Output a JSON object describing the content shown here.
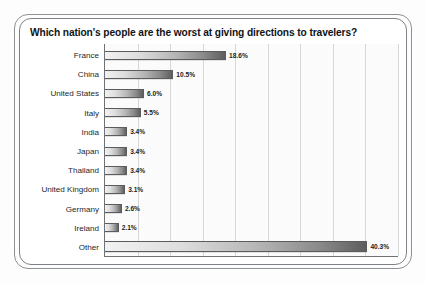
{
  "chart_data": {
    "type": "bar",
    "orientation": "horizontal",
    "title": "Which nation's people are the worst at giving directions to travelers?",
    "xlabel": "",
    "ylabel": "",
    "xlim": [
      0,
      45
    ],
    "grid": true,
    "gridline_values": [
      5,
      10,
      15,
      20,
      25,
      30,
      35,
      40,
      45
    ],
    "legend": "none",
    "categories": [
      "France",
      "China",
      "United States",
      "Italy",
      "India",
      "Japan",
      "Thailand",
      "United Kingdom",
      "Germany",
      "Ireland",
      "Other"
    ],
    "values": [
      18.6,
      10.5,
      6.0,
      5.5,
      3.4,
      3.4,
      3.4,
      3.1,
      2.6,
      2.1,
      40.3
    ],
    "value_labels": [
      "18.6%",
      "10.5%",
      "6.0%",
      "5.5%",
      "3.4%",
      "3.4%",
      "3.4%",
      "3.1%",
      "2.6%",
      "2.1%",
      "40.3%"
    ],
    "bar_color_start": "#f2f2f2",
    "bar_color_end": "#5e5e5e",
    "border_color": "#5a5c60"
  }
}
